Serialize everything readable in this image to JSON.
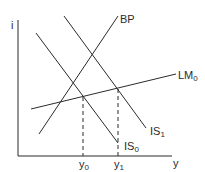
{
  "diagram": {
    "type": "IS-LM-BP",
    "axes": {
      "vertical_label": "i",
      "horizontal_label": "y"
    },
    "curves": [
      {
        "id": "BP",
        "label": "BP",
        "sub": ""
      },
      {
        "id": "LM0",
        "label": "LM",
        "sub": "0"
      },
      {
        "id": "IS1",
        "label": "IS",
        "sub": "1"
      },
      {
        "id": "IS0",
        "label": "IS",
        "sub": "0"
      }
    ],
    "ticks": [
      {
        "label": "y",
        "sub": "0"
      },
      {
        "label": "y",
        "sub": "1"
      }
    ],
    "colors": {
      "line": "#2b2b2b",
      "background": "#ffffff"
    }
  }
}
